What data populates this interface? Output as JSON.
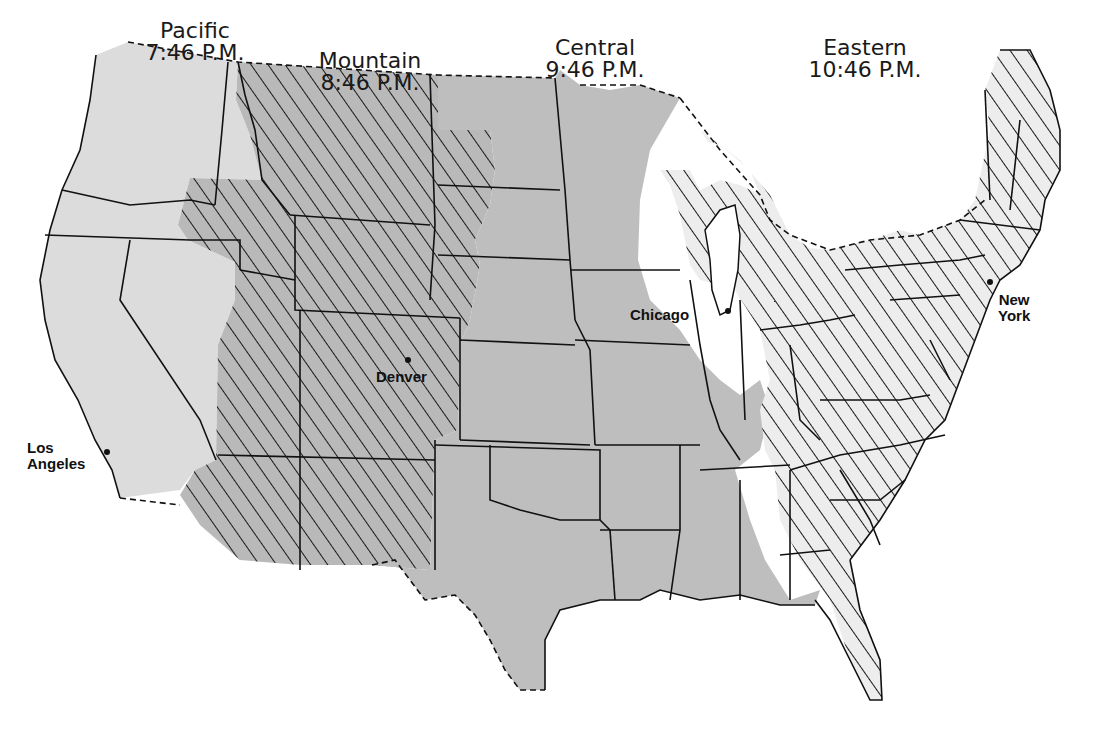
{
  "map": {
    "title": "U.S. Time Zones",
    "zones": [
      {
        "id": "pacific",
        "name": "Pacific",
        "time": "7:46 P.M.",
        "fill": "#dcdcdc",
        "hatched": false
      },
      {
        "id": "mountain",
        "name": "Mountain",
        "time": "8:46 P.M.",
        "fill": "#b9b9b9",
        "hatched": true
      },
      {
        "id": "central",
        "name": "Central",
        "time": "9:46 P.M.",
        "fill": "#bebebe",
        "hatched": false
      },
      {
        "id": "eastern",
        "name": "Eastern",
        "time": "10:46 P.M.",
        "fill": "#ededed",
        "hatched": true
      }
    ],
    "cities": [
      {
        "id": "los-angeles",
        "name_line1": "Los",
        "name_line2": "Angeles"
      },
      {
        "id": "denver",
        "name_line1": "Denver"
      },
      {
        "id": "chicago",
        "name_line1": "Chicago"
      },
      {
        "id": "new-york",
        "name_line1": "New",
        "name_line2": "York"
      }
    ],
    "colors": {
      "outline": "#111111",
      "background": "#ffffff",
      "hatch": "#1a1a1a"
    }
  }
}
